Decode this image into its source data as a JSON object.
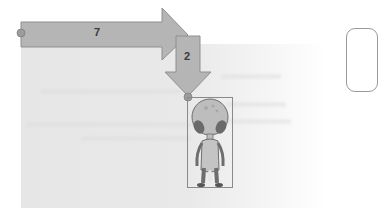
{
  "scene": {
    "arrows": [
      {
        "id": "horizontal",
        "label": "7",
        "direction": "right"
      },
      {
        "id": "vertical",
        "label": "2",
        "direction": "down"
      }
    ],
    "sprite": {
      "name": "alien"
    },
    "colors": {
      "arrow_fill": "#b5b5b5",
      "arrow_stroke": "#8f8f8f",
      "anchor_dot": "#9c9c9c",
      "canvas_bg": "#e6e6e6",
      "label_text": "#3a3a3a"
    }
  }
}
